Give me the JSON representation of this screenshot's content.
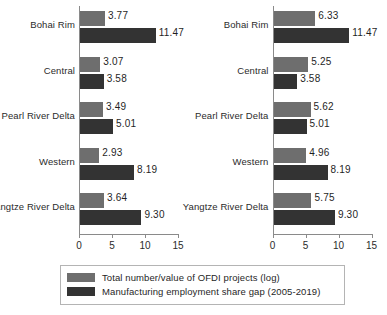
{
  "chart_data": {
    "type": "bar",
    "orientation": "horizontal",
    "title": "",
    "xlabel": "",
    "ylabel": "",
    "xlim": [
      0,
      16
    ],
    "xticks": [
      0,
      5,
      10,
      15
    ],
    "xtick_labels": [
      "0",
      "5",
      "10",
      "15"
    ],
    "grid": false,
    "legend_position": "bottom",
    "categories": [
      "Bohai Rim",
      "Central",
      "Pearl River Delta",
      "Western",
      "Yangtze River Delta"
    ],
    "panels": [
      {
        "name": "left-panel",
        "series": [
          {
            "name": "Total number/value of OFDI projects (log)",
            "color": "#6e6e6e",
            "values": [
              3.77,
              3.07,
              3.49,
              2.93,
              3.64
            ],
            "labels": [
              "3.77",
              "3.07",
              "3.49",
              "2.93",
              "3.64"
            ]
          },
          {
            "name": "Manufacturing employment share gap (2005-2019)",
            "color": "#333333",
            "values": [
              11.47,
              3.58,
              5.01,
              8.19,
              9.3
            ],
            "labels": [
              "11.47",
              "3.58",
              "5.01",
              "8.19",
              "9.30"
            ]
          }
        ]
      },
      {
        "name": "right-panel",
        "series": [
          {
            "name": "Total number/value of OFDI projects (log)",
            "color": "#6e6e6e",
            "values": [
              6.33,
              5.25,
              5.62,
              4.96,
              5.75
            ],
            "labels": [
              "6.33",
              "5.25",
              "5.62",
              "4.96",
              "5.75"
            ]
          },
          {
            "name": "Manufacturing employment share gap (2005-2019)",
            "color": "#333333",
            "values": [
              11.47,
              3.58,
              5.01,
              8.19,
              9.3
            ],
            "labels": [
              "11.47",
              "3.58",
              "5.01",
              "8.19",
              "9.30"
            ]
          }
        ]
      }
    ],
    "legend": [
      {
        "label": "Total number/value of OFDI projects  (log)",
        "color": "#6e6e6e"
      },
      {
        "label": "Manufacturing employment share gap  (2005-2019)",
        "color": "#333333"
      }
    ]
  },
  "caption": ""
}
